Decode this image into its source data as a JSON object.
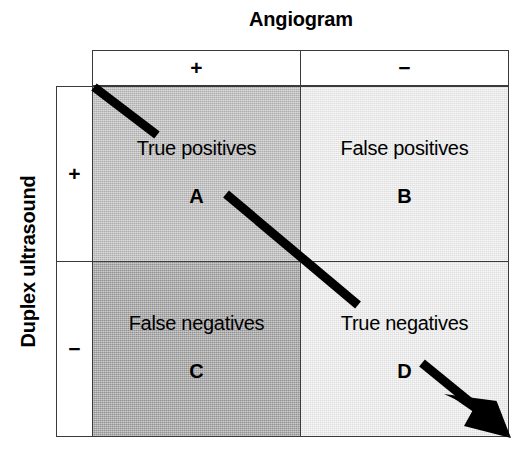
{
  "figure": {
    "type": "2x2-contingency-table",
    "column_group": {
      "title": "Angiogram",
      "headers": [
        "+",
        "−"
      ]
    },
    "row_group": {
      "title": "Duplex ultrasound",
      "headers": [
        "+",
        "−"
      ]
    },
    "cells": [
      {
        "id": "A",
        "label": "True positives",
        "letter": "A",
        "row": "+",
        "column": "+",
        "fill": "#b9b9b9"
      },
      {
        "id": "B",
        "label": "False positives",
        "letter": "B",
        "row": "+",
        "column": "−",
        "fill": "#efefef"
      },
      {
        "id": "C",
        "label": "False negatives",
        "letter": "C",
        "row": "−",
        "column": "+",
        "fill": "#9c9c9c"
      },
      {
        "id": "D",
        "label": "True negatives",
        "letter": "D",
        "row": "−",
        "column": "−",
        "fill": "#eeeeee"
      }
    ],
    "annotation": {
      "name": "diagonal-arrow",
      "color": "#000000",
      "description": "thick black diagonal arrow running from the top-left corner of cell A to the bottom-right corner of cell D, interrupted by the cell labels"
    }
  }
}
